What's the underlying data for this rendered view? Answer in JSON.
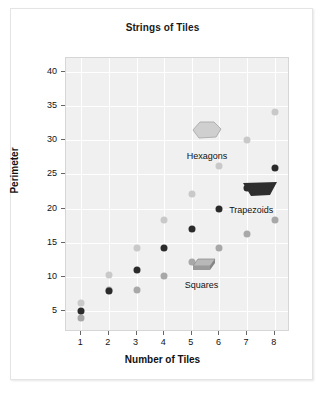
{
  "figure": {
    "title": "Strings of Tiles"
  },
  "chart_data": {
    "type": "scatter",
    "title": "Strings of Tiles",
    "xlabel": "Number of Tiles",
    "ylabel": "Perimeter",
    "xlim": [
      0.45,
      8.55
    ],
    "ylim": [
      2.0,
      42.0
    ],
    "xticks": [
      1,
      2,
      3,
      4,
      5,
      6,
      7,
      8
    ],
    "yticks": [
      5,
      10,
      15,
      20,
      25,
      30,
      35,
      40
    ],
    "xtick_labels": [
      "1",
      "2",
      "3",
      "4",
      "5",
      "6",
      "7",
      "8"
    ],
    "ytick_labels": [
      "5",
      "10",
      "15",
      "20",
      "25",
      "30",
      "35",
      "40"
    ],
    "grid": true,
    "grid_color": "#ffffff",
    "plot_background": "#f0f0f0",
    "legend": "annotations",
    "series": [
      {
        "name": "Hexagons",
        "color": "#c9c9c9",
        "marker": "circle",
        "x": [
          1,
          2,
          3,
          4,
          5,
          6,
          7,
          8
        ],
        "y": [
          6.2,
          10.3,
          14.3,
          18.3,
          22.2,
          26.2,
          30.1,
          34.1
        ]
      },
      {
        "name": "Trapezoids",
        "color": "#a8a8a8",
        "marker": "circle",
        "x": [
          1,
          2,
          3,
          4,
          5,
          6,
          7,
          8
        ],
        "y": [
          4.1,
          8.1,
          8.1,
          10.2,
          12.2,
          14.3,
          16.3,
          18.3
        ]
      },
      {
        "name": "Squares",
        "color": "#2b2b2b",
        "marker": "circle",
        "x": [
          1,
          2,
          3,
          4,
          5,
          6,
          7,
          8
        ],
        "y": [
          5.0,
          8.0,
          11.0,
          14.2,
          17.0,
          20.0,
          23.0,
          26.0
        ]
      }
    ],
    "annotations": [
      {
        "label": "Hexagons",
        "x": 5.55,
        "y": 28.4,
        "icon": "hexagon-tile-icon",
        "icon_x": 5.55,
        "icon_y": 31.2,
        "icon_color": "#cfcfcf"
      },
      {
        "label": "Trapezoids",
        "x": 7.15,
        "y": 20.6,
        "icon": "trapezoid-tile-icon",
        "icon_x": 7.45,
        "icon_y": 22.6,
        "icon_color": "#2e2e2e"
      },
      {
        "label": "Squares",
        "x": 5.35,
        "y": 9.6,
        "icon": "square-tile-icon",
        "icon_x": 5.45,
        "icon_y": 11.5,
        "icon_color": "#a0a0a0"
      }
    ]
  }
}
